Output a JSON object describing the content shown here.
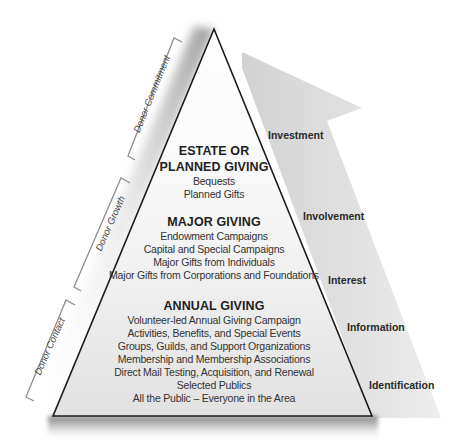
{
  "diagram": {
    "type": "donor-pyramid",
    "colors": {
      "pyramid_top": "#ffffff",
      "pyramid_bottom": "#e4e4e4",
      "pyramid_outline": "#1a1a1a",
      "arrow_fill": "#dcdcdc",
      "bracket_stroke": "#8a8a8a",
      "shadow": "#9a9a9a"
    },
    "tiers": [
      {
        "title_lines": [
          "ESTATE OR",
          "PLANNED GIVING"
        ],
        "items": [
          "Bequests",
          "Planned Gifts"
        ]
      },
      {
        "title_lines": [
          "MAJOR GIVING"
        ],
        "items": [
          "Endowment Campaigns",
          "Capital and Special Campaigns",
          "Major Gifts from Individuals",
          "Major Gifts from Corporations and Foundations"
        ]
      },
      {
        "title_lines": [
          "ANNUAL GIVING"
        ],
        "items": [
          "Volunteer-led Annual Giving Campaign",
          "Activities, Benefits, and Special Events",
          "Groups, Guilds, and Support Organizations",
          "Membership and Membership Associations",
          "Direct Mail Testing, Acquisition, and Renewal",
          "Selected Publics",
          "All the Public – Everyone in the Area"
        ]
      }
    ],
    "stages": [
      {
        "label": "Investment"
      },
      {
        "label": "Involvement"
      },
      {
        "label": "Interest"
      },
      {
        "label": "Information"
      },
      {
        "label": "Identification"
      }
    ],
    "brackets": [
      {
        "label": "Donor Commitment"
      },
      {
        "label": "Donor Growth"
      },
      {
        "label": "Donor Contact"
      }
    ]
  }
}
